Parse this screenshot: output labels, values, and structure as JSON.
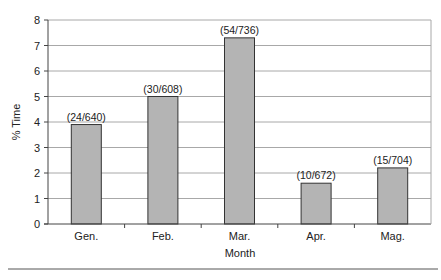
{
  "chart_data": {
    "type": "bar",
    "title": "",
    "xlabel": "Month",
    "ylabel": "% Time",
    "ylim": [
      0,
      8
    ],
    "yticks": [
      0,
      1,
      2,
      3,
      4,
      5,
      6,
      7,
      8
    ],
    "grid": true,
    "legend": null,
    "categories": [
      "Gen.",
      "Feb.",
      "Mar.",
      "Apr.",
      "Mag."
    ],
    "values": [
      3.9,
      5.0,
      7.3,
      1.6,
      2.2
    ],
    "annotations": [
      "(24/640)",
      "(30/608)",
      "(54/736)",
      "(10/672)",
      "(15/704)"
    ],
    "bar_color": "#b4b4b4",
    "bar_edge_color": "#333333",
    "grid_color": "#a8a8a8"
  }
}
